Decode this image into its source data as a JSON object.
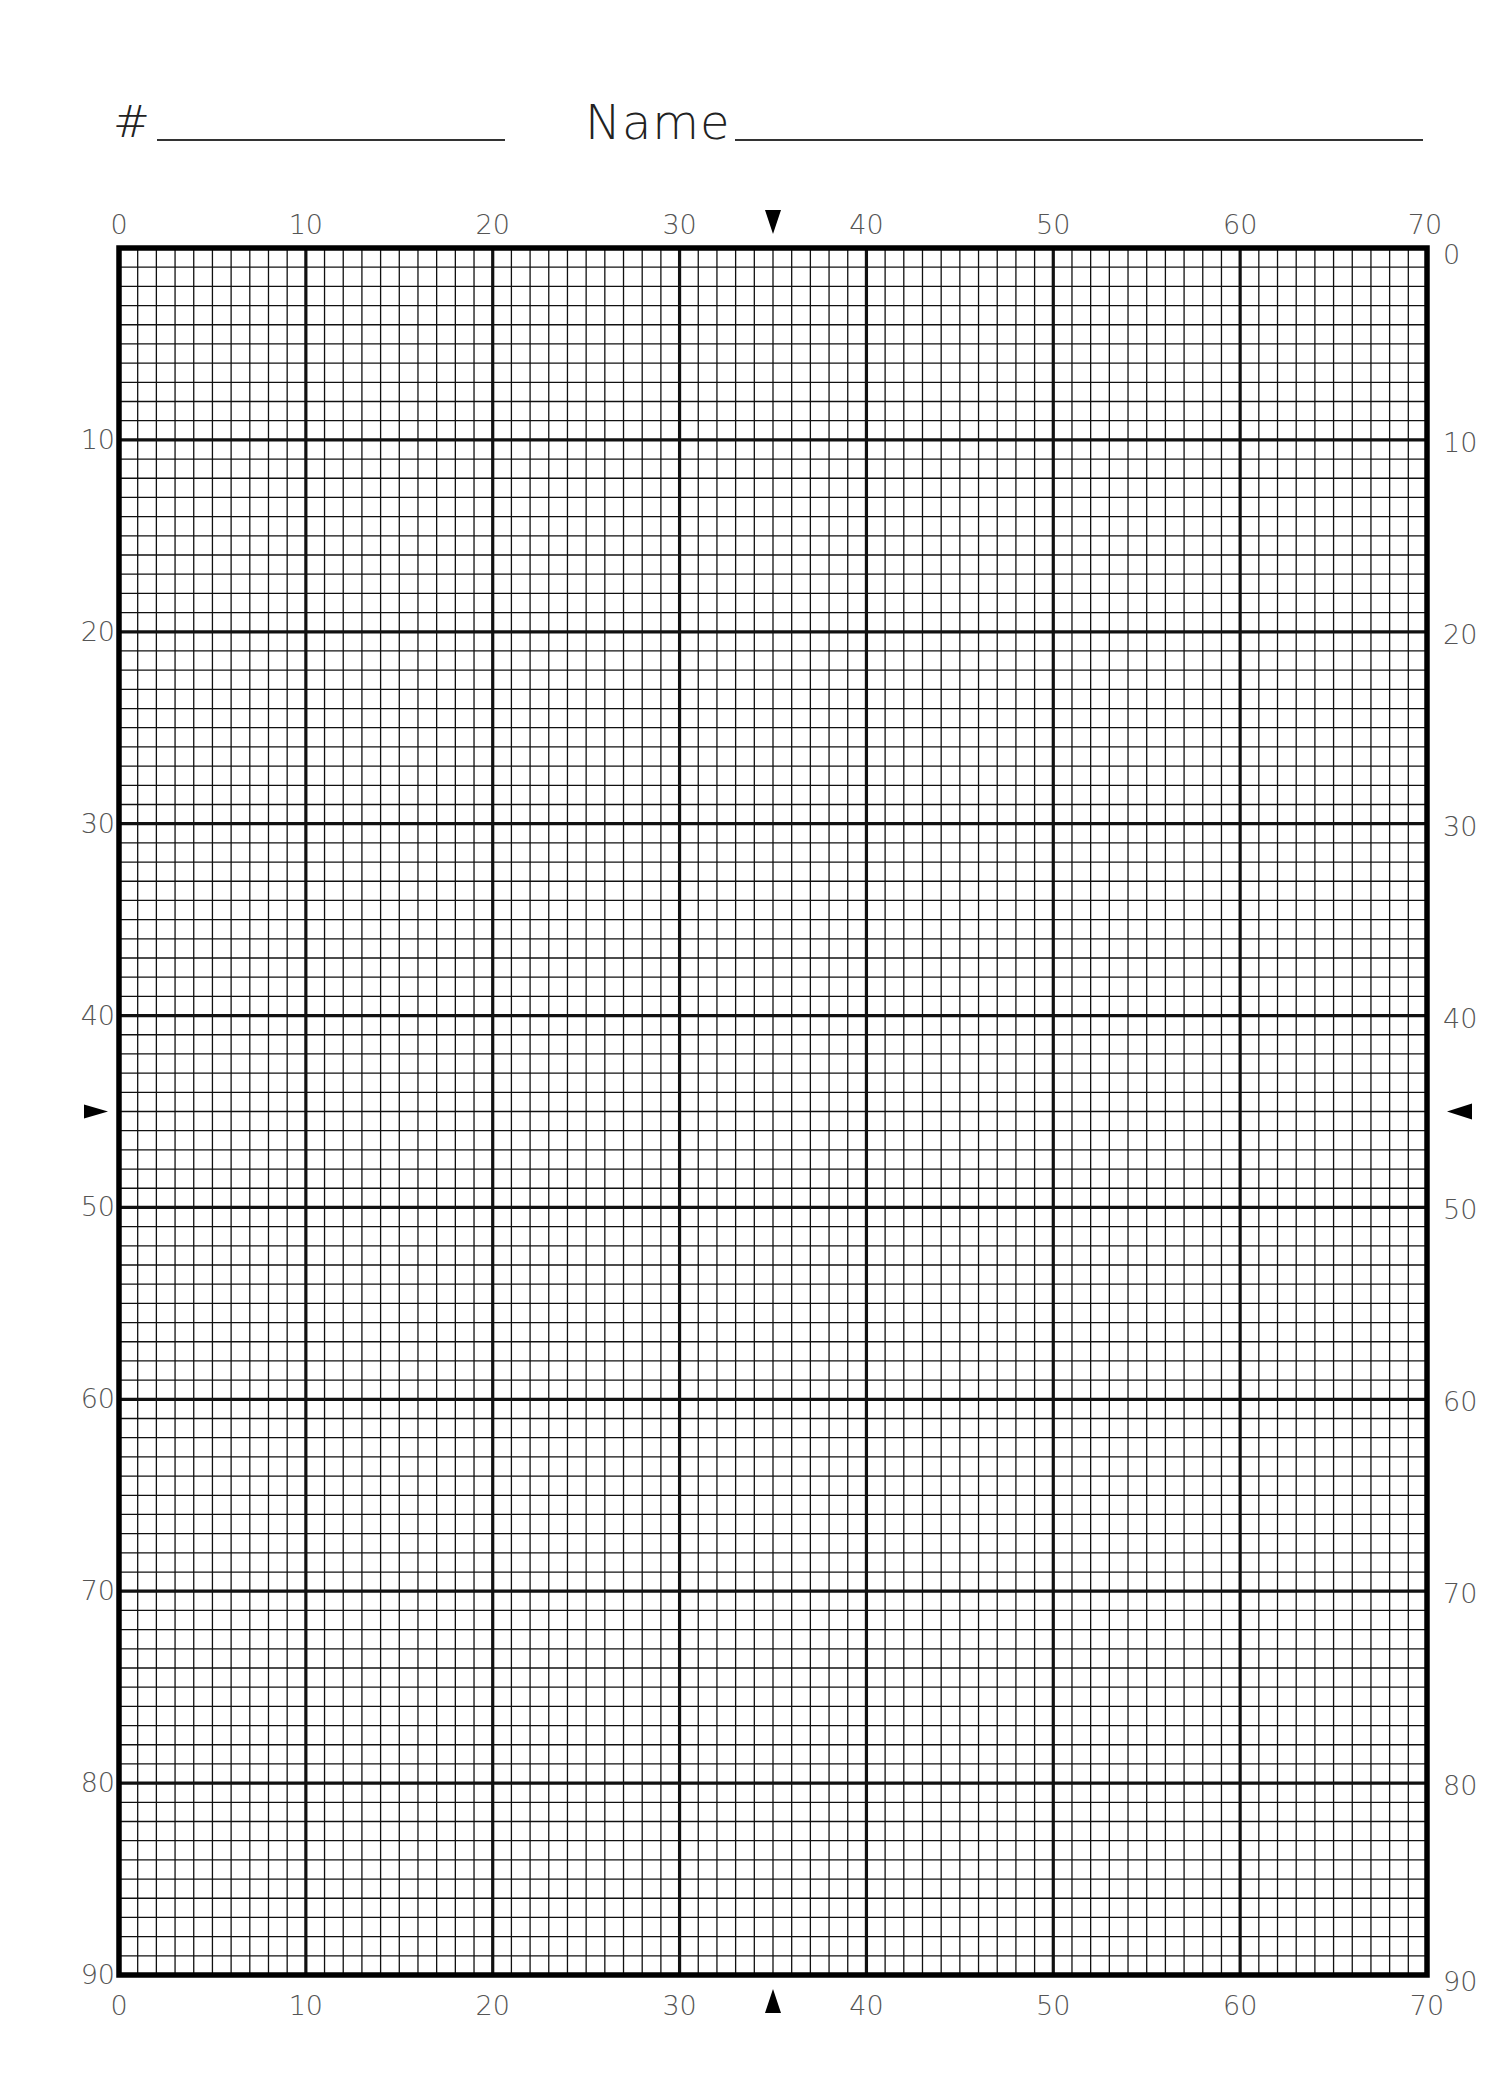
{
  "header": {
    "number_label": "#",
    "name_label": "Name"
  },
  "grid": {
    "columns": 70,
    "rows": 90,
    "major_every": 10,
    "left": 119,
    "top": 248,
    "right": 1427,
    "bottom": 1975,
    "top_labels": [
      "0",
      "10",
      "20",
      "30",
      "40",
      "50",
      "60",
      "70"
    ],
    "bottom_labels": [
      "0",
      "10",
      "20",
      "30",
      "40",
      "50",
      "60",
      "70"
    ],
    "left_labels": [
      "10",
      "20",
      "30",
      "40",
      "50",
      "60",
      "70",
      "80",
      "90"
    ],
    "right_labels": [
      "0",
      "10",
      "20",
      "30",
      "40",
      "50",
      "60",
      "70",
      "80",
      "90"
    ],
    "center_markers": {
      "column": 35,
      "row": 45
    },
    "line_color": "#111111",
    "label_color": "#555555"
  }
}
